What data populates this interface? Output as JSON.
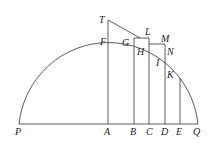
{
  "diagram": {
    "type": "geometry",
    "labels": {
      "T": "T",
      "F": "F",
      "G": "G",
      "L": "L",
      "M": "M",
      "H": "H",
      "N": "N",
      "I": "I",
      "K": "K",
      "P": "P",
      "A": "A",
      "B": "B",
      "C": "C",
      "D": "D",
      "E": "E",
      "Q": "Q"
    },
    "colors": {
      "stroke": "#333333",
      "text": "#222222",
      "background": "#ffffff"
    }
  }
}
